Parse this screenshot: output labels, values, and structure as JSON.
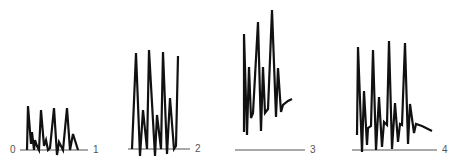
{
  "figure": {
    "panels": [
      {
        "id": 1,
        "start_label": "0",
        "end_label": "1",
        "baseline": {
          "x1": 20,
          "x2": 88,
          "y": 150
        },
        "trace": [
          [
            27,
            150
          ],
          [
            28,
            106
          ],
          [
            31,
            144
          ],
          [
            32,
            132
          ],
          [
            34,
            150
          ],
          [
            35,
            140
          ],
          [
            37,
            146
          ],
          [
            39,
            150
          ],
          [
            41,
            110
          ],
          [
            44,
            146
          ],
          [
            46,
            140
          ],
          [
            48,
            150
          ],
          [
            50,
            148
          ],
          [
            54,
            108
          ],
          [
            57,
            155
          ],
          [
            59,
            142
          ],
          [
            61,
            146
          ],
          [
            63,
            150
          ],
          [
            67,
            108
          ],
          [
            70,
            150
          ],
          [
            73,
            134
          ],
          [
            78,
            150
          ]
        ]
      },
      {
        "id": 2,
        "start_label": "",
        "end_label": "2",
        "baseline": {
          "x1": 128,
          "x2": 190,
          "y": 149
        },
        "trace": [
          [
            132,
            149
          ],
          [
            136,
            53
          ],
          [
            140,
            156
          ],
          [
            143,
            110
          ],
          [
            147,
            149
          ],
          [
            149,
            50
          ],
          [
            155,
            156
          ],
          [
            157,
            115
          ],
          [
            161,
            149
          ],
          [
            163,
            52
          ],
          [
            167,
            154
          ],
          [
            170,
            98
          ],
          [
            174,
            149
          ],
          [
            176,
            146
          ],
          [
            178,
            56
          ]
        ]
      },
      {
        "id": 3,
        "start_label": "",
        "end_label": "3",
        "baseline": {
          "x1": 235,
          "x2": 305,
          "y": 150
        },
        "trace": [
          [
            244,
            132
          ],
          [
            244,
            34
          ],
          [
            247,
            135
          ],
          [
            249,
            67
          ],
          [
            251,
            118
          ],
          [
            253,
            113
          ],
          [
            258,
            22
          ],
          [
            261,
            131
          ],
          [
            263,
            67
          ],
          [
            265,
            113
          ],
          [
            268,
            109
          ],
          [
            272,
            10
          ],
          [
            276,
            117
          ],
          [
            278,
            68
          ],
          [
            281,
            112
          ],
          [
            283,
            105
          ],
          [
            288,
            101
          ],
          [
            292,
            99
          ]
        ]
      },
      {
        "id": 4,
        "start_label": "",
        "end_label": "4",
        "baseline": {
          "x1": 352,
          "x2": 437,
          "y": 150
        },
        "trace": [
          [
            357,
            135
          ],
          [
            358,
            47
          ],
          [
            362,
            152
          ],
          [
            364,
            91
          ],
          [
            367,
            145
          ],
          [
            368,
            128
          ],
          [
            371,
            126
          ],
          [
            373,
            50
          ],
          [
            376,
            150
          ],
          [
            379,
            97
          ],
          [
            382,
            147
          ],
          [
            384,
            122
          ],
          [
            387,
            125
          ],
          [
            389,
            41
          ],
          [
            392,
            149
          ],
          [
            395,
            103
          ],
          [
            398,
            142
          ],
          [
            400,
            124
          ],
          [
            402,
            125
          ],
          [
            405,
            43
          ],
          [
            408,
            144
          ],
          [
            410,
            104
          ],
          [
            414,
            133
          ],
          [
            416,
            124
          ],
          [
            422,
            126
          ],
          [
            432,
            131
          ]
        ]
      }
    ]
  }
}
